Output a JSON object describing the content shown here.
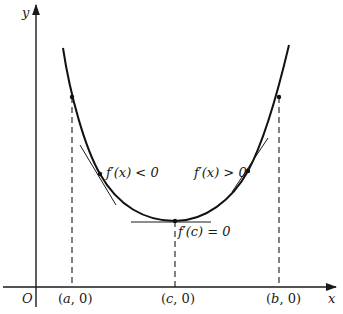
{
  "diagram": {
    "axes": {
      "x_label": "x",
      "y_label": "y",
      "origin_label": "O"
    },
    "x_ticks": [
      {
        "id": "a",
        "label_pre": "(",
        "var": "a",
        "label_post": ", 0)"
      },
      {
        "id": "c",
        "label_pre": "(",
        "var": "c",
        "label_post": ", 0)"
      },
      {
        "id": "b",
        "label_pre": "(",
        "var": "b",
        "label_post": ", 0)"
      }
    ],
    "annotations": {
      "left": "f′(x) < 0",
      "right": "f′(x) > 0",
      "min": "f′(c) = 0"
    },
    "colors": {
      "ink": "#1a1a1a",
      "background": "#ffffff"
    }
  }
}
